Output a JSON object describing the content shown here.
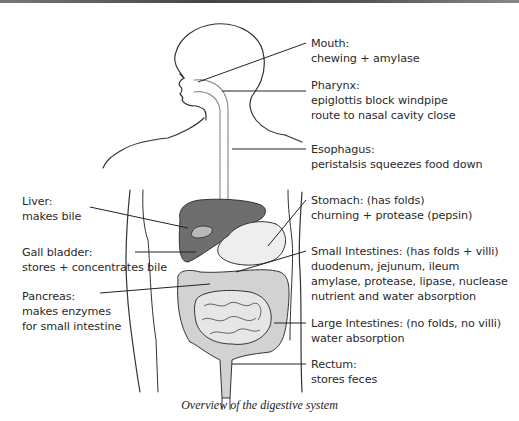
{
  "figure": {
    "caption": "Overview of the digestive system",
    "colors": {
      "liver": "#6e6e6e",
      "intestines": "#d2d2d2",
      "gall_bladder": "#b8b8b8",
      "outline": "#333333",
      "background": "#ffffff"
    }
  },
  "labels_right": [
    {
      "title": "Mouth:",
      "lines": [
        "chewing + amylase"
      ]
    },
    {
      "title": "Pharynx:",
      "lines": [
        "epiglottis block windpipe",
        "route to nasal cavity close"
      ]
    },
    {
      "title": "Esophagus:",
      "lines": [
        "peristalsis squeezes food down"
      ]
    },
    {
      "title": "Stomach: (has folds)",
      "lines": [
        "churning + protease (pepsin)"
      ]
    },
    {
      "title": "Small Intestines: (has folds + villi)",
      "lines": [
        "duodenum, jejunum, ileum",
        "amylase, protease, lipase, nuclease",
        "nutrient and water absorption"
      ]
    },
    {
      "title": "Large Intestines: (no folds, no villi)",
      "lines": [
        "water absorption"
      ]
    },
    {
      "title": "Rectum:",
      "lines": [
        "stores feces"
      ]
    }
  ],
  "labels_left": [
    {
      "title": "Liver:",
      "lines": [
        "makes bile"
      ]
    },
    {
      "title": "Gall bladder:",
      "lines": [
        "stores + concentrates bile"
      ]
    },
    {
      "title": "Pancreas:",
      "lines": [
        "makes enzymes",
        "for small intestine"
      ]
    }
  ]
}
